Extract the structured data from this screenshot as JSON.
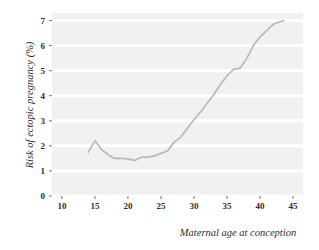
{
  "chart_data": {
    "type": "line",
    "title": "",
    "subtitle": "",
    "xlabel": "Maternal age at conception",
    "ylabel": "Risk of ectopic pregnancy (%)",
    "xlim": [
      8.5,
      46.5
    ],
    "ylim": [
      0,
      7.3
    ],
    "xticks": [
      10,
      15,
      20,
      25,
      30,
      35,
      40,
      45
    ],
    "xtick_labels": [
      "10",
      "15",
      "20",
      "25",
      "30",
      "35",
      "40",
      "45"
    ],
    "yticks": [
      0,
      1,
      2,
      3,
      4,
      5,
      6,
      7
    ],
    "ytick_labels": [
      "0",
      "1",
      "2",
      "3",
      "4",
      "5",
      "6",
      "7"
    ],
    "grid": "horizontal-white-gridlines-on-gray-panel",
    "legend": "none",
    "series": [
      {
        "name": "Risk of ectopic pregnancy",
        "color": "#b9b9b9",
        "x": [
          14,
          15,
          16,
          17,
          18,
          19,
          20,
          21,
          22,
          23,
          24,
          25,
          26,
          27,
          28,
          29,
          30,
          31,
          32,
          33,
          34,
          35,
          36,
          37,
          38,
          39,
          40,
          41,
          42,
          43,
          43.6
        ],
        "values": [
          1.75,
          2.2,
          1.85,
          1.65,
          1.5,
          1.5,
          1.48,
          1.42,
          1.55,
          1.55,
          1.6,
          1.7,
          1.8,
          2.15,
          2.35,
          2.7,
          3.05,
          3.35,
          3.7,
          4.05,
          4.45,
          4.8,
          5.05,
          5.1,
          5.5,
          6.0,
          6.35,
          6.6,
          6.85,
          6.95,
          7.0
        ]
      }
    ],
    "colors": {
      "panel_background": "#f1f1f1",
      "gridline": "#ffffff",
      "line": "#b9b9b9",
      "text": "#2e2e2e",
      "figure_background": "#ffffff"
    }
  },
  "axes": {
    "x_axis_title": "Maternal age at conception",
    "y_axis_title": "Risk of ectopic pregnancy (%)"
  }
}
